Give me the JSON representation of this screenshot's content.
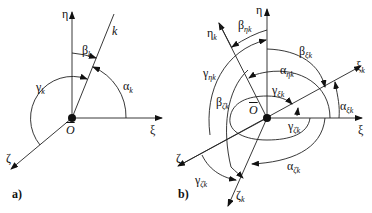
{
  "panel_a": {
    "label": "a)",
    "axis_eta": "η",
    "axis_xi": "ξ",
    "axis_zeta": "ζ",
    "line_k": "k",
    "origin": "O",
    "angles": {
      "alpha": {
        "sym": "α",
        "sub": "k"
      },
      "beta": {
        "sym": "β",
        "sub": "k"
      },
      "gamma": {
        "sym": "γ",
        "sub": "k"
      }
    }
  },
  "panel_b": {
    "label": "b)",
    "axis_eta": "η",
    "axis_xi": "ξ",
    "axis_zeta": "ζ",
    "axis_eta_k": {
      "sym": "η",
      "sub": "k"
    },
    "axis_xi_k": {
      "sym": "ξ",
      "sub": "k"
    },
    "axis_zeta_k": {
      "sym": "ζ",
      "sub": "k"
    },
    "origin": "O",
    "angles": {
      "beta_eta_k": {
        "sym": "β",
        "sub": "ηk"
      },
      "beta_xi_k": {
        "sym": "β",
        "sub": "ξk"
      },
      "gamma_eta_k": {
        "sym": "γ",
        "sub": "ηk"
      },
      "alpha_eta_k": {
        "sym": "α",
        "sub": "ηk"
      },
      "gamma_xi_k": {
        "sym": "γ",
        "sub": "ξk"
      },
      "alpha_xi_k": {
        "sym": "α",
        "sub": "ξk"
      },
      "beta_zeta_k": {
        "sym": "β",
        "sub": "ζk"
      },
      "gamma_zeta_k_inner": {
        "sym": "γ",
        "sub": "ζk"
      },
      "alpha_zeta_k": {
        "sym": "α",
        "sub": "ζk"
      },
      "gamma_zeta_k": {
        "sym": "γ",
        "sub": "ζk"
      }
    }
  }
}
